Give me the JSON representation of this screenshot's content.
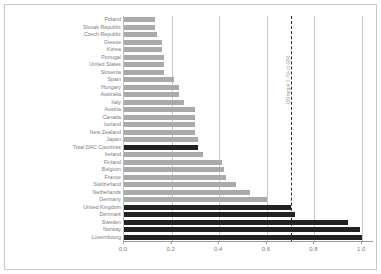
{
  "chart_data": {
    "type": "bar",
    "orientation": "horizontal",
    "title": "",
    "xlabel": "",
    "ylabel": "",
    "xlim": [
      0.0,
      1.05
    ],
    "grid": true,
    "legend": false,
    "xticks": [
      "0.0",
      "0.2",
      "0.4",
      "0.6",
      "0.8",
      "1.0"
    ],
    "xtick_values": [
      0.0,
      0.2,
      0.4,
      0.6,
      0.8,
      1.0
    ],
    "colors": {
      "bar_light": "#aaaaaa",
      "bar_dark": "#222222",
      "gridline": "#c9c9c9",
      "axis": "#9a9a9a",
      "label_text": "#7c7c7c",
      "target_line": "#2b2b2b",
      "frame": "#c8c8c8",
      "background": "#ffffff"
    },
    "annotations": [
      {
        "name": "un-target-line",
        "value": 0.7,
        "label": "UN target 0.7% of GNI",
        "style": "dashed-vertical"
      }
    ],
    "categories": [
      "Poland",
      "Slovak Republic",
      "Czech Republic",
      "Greece",
      "Korea",
      "Portugal",
      "United States",
      "Slovenia",
      "Spain",
      "Hungary",
      "Australia",
      "Italy",
      "Austria",
      "Canada",
      "Iceland",
      "New Zealand",
      "Japan",
      "Total DAC Countries",
      "Ireland",
      "Finland",
      "Belgium",
      "France",
      "Switzerland",
      "Netherlands",
      "Germany",
      "United Kingdom",
      "Denmark",
      "Sweden",
      "Norway",
      "Luxembourg"
    ],
    "values": [
      0.13,
      0.13,
      0.14,
      0.16,
      0.16,
      0.17,
      0.17,
      0.17,
      0.21,
      0.23,
      0.23,
      0.25,
      0.3,
      0.3,
      0.3,
      0.3,
      0.31,
      0.31,
      0.33,
      0.41,
      0.42,
      0.43,
      0.47,
      0.53,
      0.6,
      0.7,
      0.72,
      0.94,
      0.99,
      1.0
    ],
    "highlighted": [
      "Total DAC Countries",
      "United Kingdom",
      "Denmark",
      "Sweden",
      "Norway",
      "Luxembourg"
    ]
  }
}
